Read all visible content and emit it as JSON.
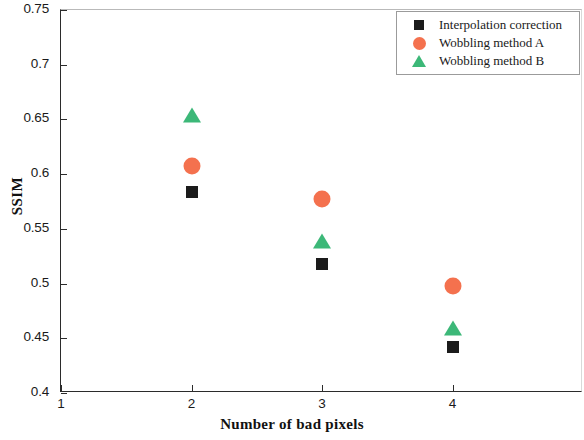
{
  "chart_data": {
    "type": "scatter",
    "title": "",
    "xlabel": "Number of bad pixels",
    "ylabel": "SSIM",
    "xlim": [
      1,
      5
    ],
    "ylim": [
      0.4,
      0.75
    ],
    "grid": false,
    "legend_position": "top-right",
    "x_ticks": [
      "1",
      "2",
      "3",
      "4"
    ],
    "x_tick_values": [
      1,
      2,
      3,
      4
    ],
    "y_ticks": [
      "0.4",
      "0.45",
      "0.5",
      "0.55",
      "0.6",
      "0.65",
      "0.7",
      "0.75"
    ],
    "y_tick_values": [
      0.4,
      0.45,
      0.5,
      0.55,
      0.6,
      0.65,
      0.7,
      0.75
    ],
    "categories": [
      2,
      3,
      4
    ],
    "series": [
      {
        "name": "Interpolation correction",
        "marker": "square",
        "color": "#1b1b1b",
        "x": [
          2,
          3,
          4
        ],
        "values": [
          0.584,
          0.518,
          0.442
        ]
      },
      {
        "name": "Wobbling method A",
        "marker": "circle",
        "color": "#F4714E",
        "x": [
          2,
          3,
          4
        ],
        "values": [
          0.607,
          0.577,
          0.498
        ]
      },
      {
        "name": "Wobbling method B",
        "marker": "triangle",
        "color": "#3CB878",
        "x": [
          2,
          3,
          4
        ],
        "values": [
          0.655,
          0.54,
          0.46
        ]
      }
    ]
  },
  "legend": {
    "items": [
      {
        "label": "Interpolation correction",
        "marker": "square",
        "color": "#1b1b1b"
      },
      {
        "label": "Wobbling method A",
        "marker": "circle",
        "color": "#F4714E"
      },
      {
        "label": "Wobbling method B",
        "marker": "triangle",
        "color": "#3CB878"
      }
    ]
  }
}
